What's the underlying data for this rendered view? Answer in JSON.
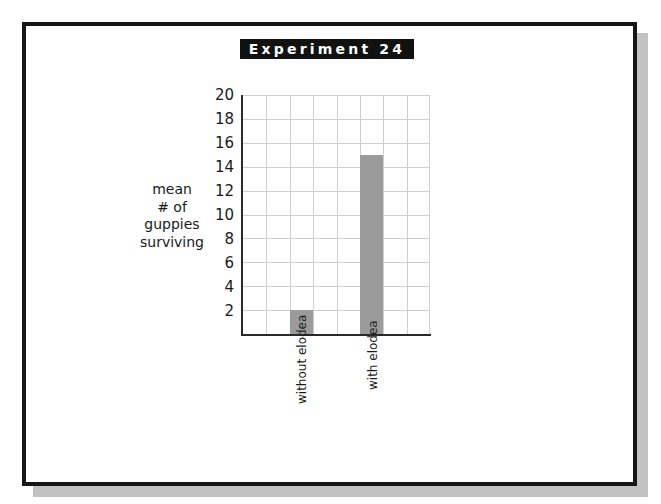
{
  "chart_data": {
    "type": "bar",
    "title": "Experiment 24",
    "categories": [
      "without elodea",
      "with elodea"
    ],
    "values": [
      2,
      15
    ],
    "xlabel": "",
    "ylabel": "mean # of guppies surviving",
    "ylabel_lines": [
      "mean",
      "# of",
      "guppies",
      "surviving"
    ],
    "ylim": [
      0,
      20
    ],
    "yticks": [
      2,
      4,
      6,
      8,
      10,
      12,
      14,
      16,
      18,
      20
    ],
    "grid": true,
    "grid_columns": 8,
    "bar_columns": [
      2,
      5
    ],
    "legend": null,
    "colors": {
      "bar": "#9b9b9b",
      "grid": "#cfcfcf",
      "axis": "#2a2a2a",
      "title_bg": "#111111",
      "title_fg": "#ffffff"
    }
  },
  "labels": {
    "title": "Experiment 24",
    "y_title": [
      "mean",
      "# of",
      "guppies",
      "surviving"
    ],
    "y_ticks": [
      "20",
      "18",
      "16",
      "14",
      "12",
      "10",
      "8",
      "6",
      "4",
      "2"
    ],
    "x_categories": [
      "without elodea",
      "with elodea"
    ]
  }
}
